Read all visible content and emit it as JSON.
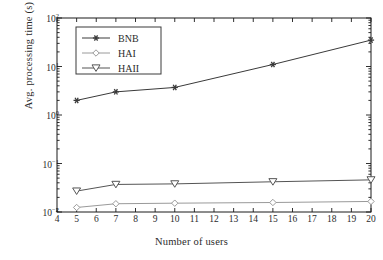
{
  "chart_data": {
    "type": "line",
    "title": "",
    "xlabel": "Number of users",
    "ylabel": "Avg. processing time (s)",
    "x": [
      5,
      7,
      10,
      15,
      20
    ],
    "xlim": [
      4,
      20
    ],
    "ylim": [
      0.01,
      100
    ],
    "yscale": "log",
    "xticks": [
      4,
      5,
      6,
      7,
      8,
      9,
      10,
      11,
      12,
      13,
      14,
      15,
      16,
      17,
      18,
      19,
      20
    ],
    "xtick_labels": [
      "4",
      "5",
      "6",
      "7",
      "8",
      "9",
      "10",
      "11",
      "12",
      "13",
      "14",
      "15",
      "16",
      "17",
      "18",
      "19",
      "20"
    ],
    "yticks": [
      0.01,
      0.1,
      1,
      10,
      100
    ],
    "ytick_labels": [
      "10⁻²",
      "10⁻¹",
      "10⁰",
      "10¹",
      "10²"
    ],
    "grid": false,
    "legend_position": "upper left",
    "series": [
      {
        "name": "BNB",
        "marker": "star",
        "color": "#3a3a3a",
        "values": [
          2.0,
          3.0,
          3.7,
          11.0,
          35.0
        ]
      },
      {
        "name": "HAI",
        "marker": "diamond",
        "color": "#9a9a9a",
        "values": [
          0.0124,
          0.0148,
          0.0152,
          0.0157,
          0.0165
        ]
      },
      {
        "name": "HAII",
        "marker": "triangle-down",
        "color": "#555555",
        "values": [
          0.027,
          0.037,
          0.038,
          0.042,
          0.046
        ]
      }
    ]
  },
  "axes": {
    "frame_color": "#1a1a1a",
    "background": "#ffffff"
  },
  "legend": {
    "entries": [
      "BNB",
      "HAI",
      "HAII"
    ],
    "border_color": "#3a3a3a"
  }
}
